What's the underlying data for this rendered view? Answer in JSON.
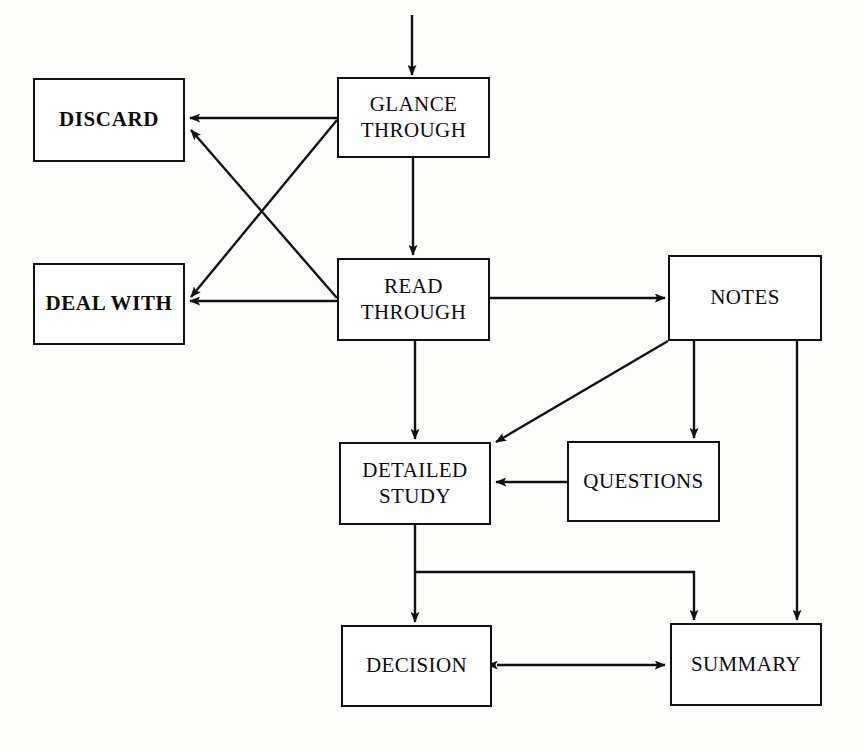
{
  "diagram": {
    "canvas": {
      "width": 863,
      "height": 751,
      "background": "#fdfdfc"
    },
    "line_color": "#111111",
    "box_fill": "#ffffff",
    "nodes": [
      {
        "id": "discard",
        "label": "DISCARD",
        "style": "bold"
      },
      {
        "id": "dealwith",
        "label": "DEAL WITH",
        "style": "bold"
      },
      {
        "id": "glance",
        "label": "GLANCE\nTHROUGH",
        "style": "regular"
      },
      {
        "id": "read",
        "label": "READ\nTHROUGH",
        "style": "regular"
      },
      {
        "id": "notes",
        "label": "NOTES",
        "style": "regular"
      },
      {
        "id": "detailed",
        "label": "DETAILED\nSTUDY",
        "style": "regular"
      },
      {
        "id": "questions",
        "label": "QUESTIONS",
        "style": "regular"
      },
      {
        "id": "decision",
        "label": "DECISION",
        "style": "regular"
      },
      {
        "id": "summary",
        "label": "SUMMARY",
        "style": "regular"
      }
    ],
    "edges": [
      {
        "id": "entry-to-glance",
        "from": "(start)",
        "to": "glance",
        "kind": "arrow"
      },
      {
        "id": "glance-to-discard",
        "from": "glance",
        "to": "discard",
        "kind": "arrow"
      },
      {
        "id": "glance-to-dealwith",
        "from": "glance",
        "to": "dealwith",
        "kind": "arrow"
      },
      {
        "id": "glance-to-read",
        "from": "glance",
        "to": "read",
        "kind": "arrow"
      },
      {
        "id": "read-to-discard",
        "from": "read",
        "to": "discard",
        "kind": "arrow"
      },
      {
        "id": "read-to-dealwith",
        "from": "read",
        "to": "dealwith",
        "kind": "arrow"
      },
      {
        "id": "read-to-notes",
        "from": "read",
        "to": "notes",
        "kind": "arrow"
      },
      {
        "id": "read-to-detailed",
        "from": "read",
        "to": "detailed",
        "kind": "arrow"
      },
      {
        "id": "notes-to-detailed",
        "from": "notes",
        "to": "detailed",
        "kind": "arrow"
      },
      {
        "id": "notes-to-questions",
        "from": "notes",
        "to": "questions",
        "kind": "arrow"
      },
      {
        "id": "notes-to-summary",
        "from": "notes",
        "to": "summary",
        "kind": "arrow"
      },
      {
        "id": "questions-to-detailed",
        "from": "questions",
        "to": "detailed",
        "kind": "arrow"
      },
      {
        "id": "detailed-to-decision",
        "from": "detailed",
        "to": "decision",
        "kind": "arrow"
      },
      {
        "id": "detailed-to-summary",
        "from": "detailed",
        "to": "summary",
        "kind": "arrow-elbow"
      },
      {
        "id": "decision-summary-both",
        "from": "decision",
        "to": "summary",
        "kind": "double-arrow"
      }
    ]
  }
}
